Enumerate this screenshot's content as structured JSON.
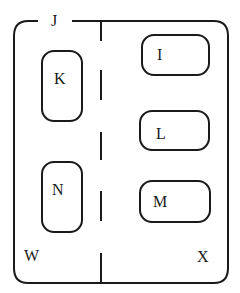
{
  "diagram": {
    "outer_label": "J",
    "left_region_label": "W",
    "right_region_label": "X",
    "left_nodes": [
      {
        "id": "K",
        "label": "K"
      },
      {
        "id": "N",
        "label": "N"
      }
    ],
    "right_nodes": [
      {
        "id": "I",
        "label": "I"
      },
      {
        "id": "L",
        "label": "L"
      },
      {
        "id": "M",
        "label": "M"
      }
    ],
    "colors": {
      "stroke": "#1a1a1a",
      "background": "#ffffff"
    }
  }
}
